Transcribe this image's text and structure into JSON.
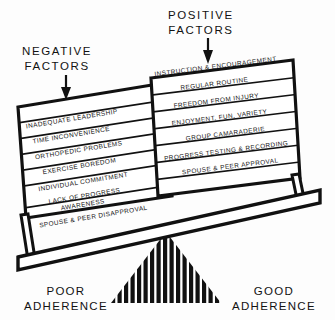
{
  "diagram": {
    "ink_color": "#111111",
    "paper_color": "#fdfdfd"
  },
  "headers": {
    "negative": {
      "line1": "NEGATIVE",
      "line2": "FACTORS"
    },
    "positive": {
      "line1": "POSITIVE",
      "line2": "FACTORS"
    }
  },
  "arrows": {
    "negative_arrow": "down-arrow-icon",
    "positive_arrow": "down-arrow-icon"
  },
  "negative_stack": {
    "side": "left",
    "items": [
      {
        "text": "INADEQUATE  LEADERSHIP"
      },
      {
        "text": "TIME INCONVENIENCE"
      },
      {
        "text": "ORTHOPEDIC PROBLEMS"
      },
      {
        "text": "EXERCISE BOREDOM"
      },
      {
        "text": "INDIVIDUAL COMMITMENT"
      },
      {
        "text": "LACK OF PROGRESS",
        "text2": "AWARENESS"
      },
      {
        "text": "SPOUSE & PEER DISAPPROVAL"
      }
    ]
  },
  "positive_stack": {
    "side": "right",
    "items": [
      {
        "text": "INSTRUCTION & ENCOURAGEMENT"
      },
      {
        "text": "REGULAR ROUTINE"
      },
      {
        "text": "FREEDOM FROM INJURY"
      },
      {
        "text": "ENJOYMENT, FUN, VARIETY"
      },
      {
        "text": "GROUP CAMARADERIE"
      },
      {
        "text": "PROGRESS TESTING & RECORDING"
      },
      {
        "text": "SPOUSE & PEER APPROVAL"
      }
    ]
  },
  "footers": {
    "poor": {
      "line1": "POOR",
      "line2": "ADHERENCE"
    },
    "good": {
      "line1": "GOOD",
      "line2": "ADHERENCE"
    }
  },
  "fulcrum": {
    "name": "striped-triangle-fulcrum",
    "stripes": 17
  }
}
